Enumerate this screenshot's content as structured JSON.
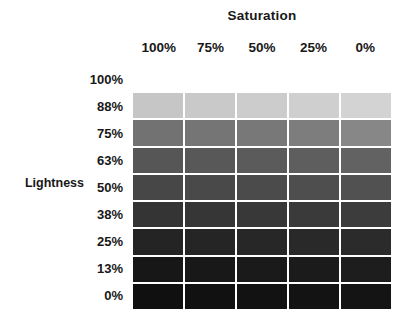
{
  "chart_data": {
    "type": "heatmap",
    "title": "",
    "xlabel": "Saturation",
    "ylabel": "Lightness",
    "x_categories": [
      "100%",
      "75%",
      "50%",
      "25%",
      "0%"
    ],
    "y_categories": [
      "100%",
      "88%",
      "75%",
      "63%",
      "50%",
      "38%",
      "25%",
      "13%",
      "0%"
    ],
    "grid": false,
    "legend": "none",
    "rows": [
      {
        "lightness": "100%",
        "visible": false,
        "cells": [
          "#ffffff",
          "#ffffff",
          "#ffffff",
          "#ffffff",
          "#ffffff"
        ]
      },
      {
        "lightness": "88%",
        "visible": true,
        "cells": [
          "#c6c6c6",
          "#c9c9c9",
          "#cccccc",
          "#cfcfcf",
          "#d3d3d3"
        ]
      },
      {
        "lightness": "75%",
        "visible": true,
        "cells": [
          "#727272",
          "#757575",
          "#787878",
          "#7d7d7d",
          "#878787"
        ]
      },
      {
        "lightness": "63%",
        "visible": true,
        "cells": [
          "#565656",
          "#585858",
          "#5b5b5b",
          "#5e5e5e",
          "#626262"
        ]
      },
      {
        "lightness": "50%",
        "visible": true,
        "cells": [
          "#474747",
          "#494949",
          "#4b4b4b",
          "#4e4e4e",
          "#515151"
        ]
      },
      {
        "lightness": "38%",
        "visible": true,
        "cells": [
          "#343434",
          "#363636",
          "#383838",
          "#3a3a3a",
          "#3c3c3c"
        ]
      },
      {
        "lightness": "25%",
        "visible": true,
        "cells": [
          "#242424",
          "#252525",
          "#272727",
          "#292929",
          "#2b2b2b"
        ]
      },
      {
        "lightness": "13%",
        "visible": true,
        "cells": [
          "#171717",
          "#181818",
          "#1a1a1a",
          "#1b1b1b",
          "#1d1d1d"
        ]
      },
      {
        "lightness": "0%",
        "visible": true,
        "cells": [
          "#101010",
          "#111111",
          "#121212",
          "#131313",
          "#141414"
        ]
      }
    ]
  },
  "axes": {
    "saturation": {
      "title": "Saturation",
      "ticks": [
        "100%",
        "75%",
        "50%",
        "25%",
        "0%"
      ]
    },
    "lightness": {
      "title": "Lightness",
      "ticks": [
        "100%",
        "88%",
        "75%",
        "63%",
        "50%",
        "38%",
        "25%",
        "13%",
        "0%"
      ]
    }
  },
  "colors": {
    "background": "#ffffff",
    "text": "#181818",
    "cell_gap": "#ffffff"
  }
}
